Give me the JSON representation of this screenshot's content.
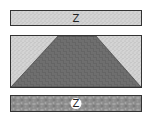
{
  "diagram": {
    "type": "geologic-cross-section",
    "layers": [
      {
        "id": "top-layer",
        "texture": "fine-stipple",
        "label": "Z",
        "color": "#cfcfcf"
      },
      {
        "id": "middle-layer",
        "texture": "stipple-with-basket-weave-trapezoid",
        "label": "",
        "color": "#d2d2d2",
        "inclusion_color": "#5a5a5a"
      },
      {
        "id": "bottom-layer",
        "texture": "cobble",
        "label": "Z",
        "color": "#8f8f8f"
      }
    ],
    "border_color": "#333333"
  }
}
